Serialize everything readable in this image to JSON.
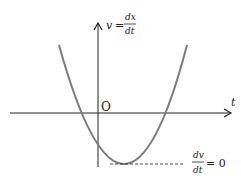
{
  "diagram": {
    "type": "velocity-time graph",
    "y_axis_label": {
      "lhs": "v",
      "eq": "=",
      "num": "dx",
      "den": "dt"
    },
    "x_axis_label": "t",
    "origin_label": "O",
    "annotation": {
      "num": "dv",
      "den": "dt",
      "rhs": "= 0"
    },
    "curve": "upward parabola with minimum below t-axis",
    "colors": {
      "curve": "#7a7a7a",
      "axes": "#222222",
      "dashed": "#333333"
    }
  }
}
